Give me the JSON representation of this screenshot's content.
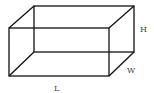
{
  "diagram": {
    "type": "cuboid-wireframe",
    "labels": {
      "height": "H",
      "width": "W",
      "length": "L"
    },
    "colors": {
      "edge": "#111111",
      "label": "#444444",
      "background": "#ffffff"
    }
  }
}
